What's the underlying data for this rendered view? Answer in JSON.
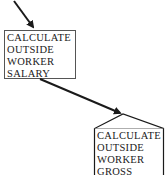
{
  "diagram": {
    "type": "flow",
    "nodes": [
      {
        "id": "calc-outside-worker-salary",
        "shape": "rectangle",
        "lines": [
          "CALCULATE",
          "OUTSIDE",
          "WORKER",
          "SALARY"
        ]
      },
      {
        "id": "calc-outside-worker-gross",
        "shape": "house",
        "lines": [
          "CALCULATE",
          "OUTSIDE",
          "WORKER",
          "GROSS"
        ]
      }
    ],
    "edges": [
      {
        "from": "offscreen-top",
        "to": "calc-outside-worker-salary"
      },
      {
        "from": "calc-outside-worker-salary",
        "to": "calc-outside-worker-gross"
      }
    ]
  },
  "colors": {
    "stroke": "#1a1a1a",
    "box_border": "#555555",
    "background": "#ffffff"
  }
}
